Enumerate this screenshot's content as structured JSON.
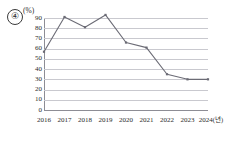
{
  "figure": {
    "item_number": "④",
    "y_unit_label": "(%)",
    "x_unit_label": "(년)"
  },
  "chart_data": {
    "type": "line",
    "title": "",
    "subtitle": "",
    "xlabel": "(년)",
    "ylabel": "(%)",
    "categories": [
      "2016",
      "2017",
      "2018",
      "2019",
      "2020",
      "2021",
      "2022",
      "2023",
      "2024"
    ],
    "values": [
      57,
      91,
      81,
      93,
      66,
      61,
      35,
      30,
      30
    ],
    "series": [
      {
        "name": "",
        "values": [
          57,
          91,
          81,
          93,
          66,
          61,
          35,
          30,
          30
        ]
      }
    ],
    "ylim": [
      0,
      90
    ],
    "ytick_labels": [
      "90",
      "80",
      "70",
      "60",
      "50",
      "40",
      "30",
      "20",
      "10",
      "0"
    ],
    "ytick_values": [
      90,
      80,
      70,
      60,
      50,
      40,
      30,
      20,
      10,
      0
    ],
    "ystep": 10,
    "xtick_labels": [
      "2016",
      "2017",
      "2018",
      "2019",
      "2020",
      "2021",
      "2022",
      "2023",
      "2024"
    ],
    "grid": true,
    "legend": false,
    "legend_position": "none",
    "marker": "small-square",
    "line_color": "#6b6b75",
    "grid_color": "#c9c9cf",
    "axis_color": "#8d8d95",
    "text_color": "#2b2b2b",
    "annotations": []
  }
}
